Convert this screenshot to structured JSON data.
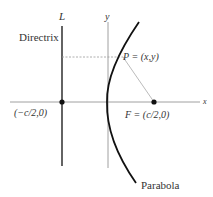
{
  "diagram": {
    "labels": {
      "directrix_line": "L",
      "directrix": "Directrix",
      "y_axis": "y",
      "x_axis": "x",
      "point": "P = (x,y)",
      "focus": "F = (c/2,0)",
      "directrix_point": "(−c/2,0)",
      "curve": "Parabola"
    },
    "colors": {
      "curve": "#111111",
      "axes": "#888888",
      "lines": "#999999",
      "dots": "#111111"
    }
  }
}
